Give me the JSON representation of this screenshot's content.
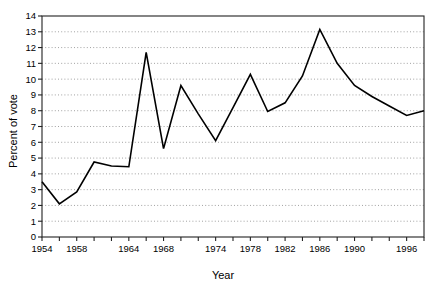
{
  "chart_data": {
    "type": "line",
    "title": "",
    "xlabel": "Year",
    "ylabel": "Percent of vote",
    "xlim": [
      1954,
      1998
    ],
    "ylim": [
      0,
      14
    ],
    "grid": true,
    "grid_style": "dotted",
    "legend": "none",
    "line_color": "#000000",
    "x": [
      1954,
      1956,
      1958,
      1960,
      1962,
      1964,
      1966,
      1968,
      1970,
      1972,
      1974,
      1976,
      1978,
      1980,
      1982,
      1984,
      1986,
      1988,
      1990,
      1992,
      1994,
      1996,
      1998
    ],
    "series": [
      {
        "name": "Percent of vote",
        "values": [
          3.5,
          2.1,
          2.85,
          4.75,
          4.5,
          4.45,
          11.7,
          5.6,
          9.6,
          7.8,
          6.1,
          8.2,
          10.3,
          7.95,
          8.5,
          10.2,
          13.15,
          11.0,
          9.6,
          8.9,
          8.3,
          7.7,
          8.0
        ]
      }
    ],
    "xticks": [
      1954,
      1956,
      1958,
      1960,
      1962,
      1964,
      1966,
      1968,
      1970,
      1972,
      1974,
      1976,
      1978,
      1980,
      1982,
      1984,
      1986,
      1988,
      1990,
      1992,
      1994,
      1996,
      1998
    ],
    "xticklabels": [
      "1954",
      "",
      "1958",
      "",
      "",
      "1964",
      "",
      "1968",
      "",
      "",
      "1974",
      "",
      "1978",
      "",
      "1982",
      "",
      "1986",
      "",
      "1990",
      "",
      "",
      "1996",
      ""
    ],
    "yticks": [
      0,
      1,
      2,
      3,
      4,
      5,
      6,
      7,
      8,
      9,
      10,
      11,
      12,
      13,
      14
    ],
    "yticklabels": [
      "0",
      "1",
      "2",
      "3",
      "4",
      "5",
      "6",
      "7",
      "8",
      "9",
      "10",
      "11",
      "12",
      "13",
      "14"
    ]
  }
}
